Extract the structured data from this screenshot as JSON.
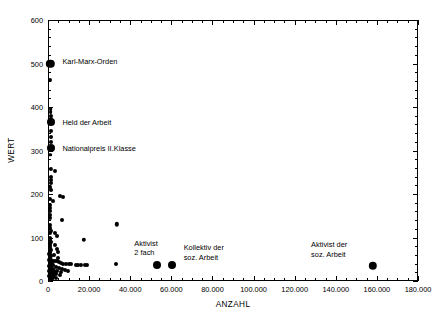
{
  "chart_data": {
    "type": "scatter",
    "title": "",
    "xlabel": "ANZAHL",
    "ylabel": "WERT",
    "xlim": [
      0,
      180000
    ],
    "ylim": [
      0,
      600
    ],
    "xticks": [
      0,
      20000,
      40000,
      60000,
      80000,
      100000,
      120000,
      140000,
      160000,
      180000
    ],
    "xticklabels": [
      "0",
      "20.000",
      "40.000",
      "60.000",
      "80.000",
      "100.000",
      "120.000",
      "140.000",
      "160.000",
      "180.000"
    ],
    "yticks": [
      0,
      100,
      200,
      300,
      400,
      500,
      600
    ],
    "yticklabels": [
      "0",
      "100",
      "200",
      "300",
      "400",
      "500",
      "600"
    ],
    "x_minor_step": 5000,
    "y_minor_step": 20,
    "grid": false,
    "legend": null,
    "marker_color": "#000000",
    "points": [
      {
        "x": 1200,
        "y": 500,
        "r": 4.2
      },
      {
        "x": 1100,
        "y": 462,
        "r": 2.0
      },
      {
        "x": 1300,
        "y": 395,
        "r": 1.9
      },
      {
        "x": 1300,
        "y": 388,
        "r": 1.9
      },
      {
        "x": 1300,
        "y": 380,
        "r": 2.0
      },
      {
        "x": 1300,
        "y": 373,
        "r": 2.1
      },
      {
        "x": 1400,
        "y": 365,
        "r": 4.0
      },
      {
        "x": 1300,
        "y": 345,
        "r": 2.0
      },
      {
        "x": 1300,
        "y": 330,
        "r": 2.0
      },
      {
        "x": 1300,
        "y": 320,
        "r": 2.0
      },
      {
        "x": 1400,
        "y": 305,
        "r": 4.0
      },
      {
        "x": 1200,
        "y": 290,
        "r": 1.8
      },
      {
        "x": 1500,
        "y": 257,
        "r": 2.1
      },
      {
        "x": 3500,
        "y": 252,
        "r": 2.0
      },
      {
        "x": 1300,
        "y": 240,
        "r": 2.0
      },
      {
        "x": 1300,
        "y": 232,
        "r": 2.0
      },
      {
        "x": 1300,
        "y": 225,
        "r": 2.0
      },
      {
        "x": 1200,
        "y": 217,
        "r": 2.0
      },
      {
        "x": 1300,
        "y": 210,
        "r": 2.0
      },
      {
        "x": 6000,
        "y": 196,
        "r": 2.0
      },
      {
        "x": 7200,
        "y": 193,
        "r": 2.0
      },
      {
        "x": 1200,
        "y": 188,
        "r": 2.0
      },
      {
        "x": 2500,
        "y": 183,
        "r": 2.0
      },
      {
        "x": 1100,
        "y": 175,
        "r": 2.0
      },
      {
        "x": 1100,
        "y": 168,
        "r": 2.0
      },
      {
        "x": 1200,
        "y": 160,
        "r": 2.0
      },
      {
        "x": 1100,
        "y": 152,
        "r": 2.0
      },
      {
        "x": 1200,
        "y": 145,
        "r": 2.0
      },
      {
        "x": 7000,
        "y": 141,
        "r": 2.0
      },
      {
        "x": 33500,
        "y": 130,
        "r": 2.2
      },
      {
        "x": 1200,
        "y": 128,
        "r": 2.0
      },
      {
        "x": 1100,
        "y": 122,
        "r": 2.0
      },
      {
        "x": 1300,
        "y": 116,
        "r": 2.0
      },
      {
        "x": 1200,
        "y": 110,
        "r": 2.0
      },
      {
        "x": 3400,
        "y": 110,
        "r": 2.0
      },
      {
        "x": 4300,
        "y": 103,
        "r": 2.0
      },
      {
        "x": 1200,
        "y": 100,
        "r": 2.0
      },
      {
        "x": 1100,
        "y": 95,
        "r": 2.0
      },
      {
        "x": 17500,
        "y": 95,
        "r": 2.2
      },
      {
        "x": 1300,
        "y": 90,
        "r": 2.0
      },
      {
        "x": 1200,
        "y": 85,
        "r": 2.0
      },
      {
        "x": 3600,
        "y": 83,
        "r": 2.0
      },
      {
        "x": 1100,
        "y": 80,
        "r": 2.0
      },
      {
        "x": 1200,
        "y": 76,
        "r": 2.0
      },
      {
        "x": 4200,
        "y": 74,
        "r": 2.0
      },
      {
        "x": 1300,
        "y": 72,
        "r": 2.0
      },
      {
        "x": 1100,
        "y": 68,
        "r": 2.0
      },
      {
        "x": 5000,
        "y": 66,
        "r": 2.0
      },
      {
        "x": 1200,
        "y": 64,
        "r": 2.0
      },
      {
        "x": 1100,
        "y": 60,
        "r": 2.0
      },
      {
        "x": 3000,
        "y": 60,
        "r": 2.0
      },
      {
        "x": 1300,
        "y": 57,
        "r": 2.0
      },
      {
        "x": 1200,
        "y": 54,
        "r": 2.0
      },
      {
        "x": 4800,
        "y": 52,
        "r": 2.0
      },
      {
        "x": 1100,
        "y": 50,
        "r": 2.0
      },
      {
        "x": 1300,
        "y": 48,
        "r": 2.0
      },
      {
        "x": 2200,
        "y": 47,
        "r": 2.0
      },
      {
        "x": 3300,
        "y": 46,
        "r": 2.0
      },
      {
        "x": 4500,
        "y": 45,
        "r": 2.0
      },
      {
        "x": 5500,
        "y": 44,
        "r": 2.0
      },
      {
        "x": 1200,
        "y": 44,
        "r": 2.0
      },
      {
        "x": 1100,
        "y": 42,
        "r": 2.0
      },
      {
        "x": 6500,
        "y": 42,
        "r": 2.0
      },
      {
        "x": 1300,
        "y": 40,
        "r": 2.0
      },
      {
        "x": 2000,
        "y": 40,
        "r": 2.0
      },
      {
        "x": 7500,
        "y": 40,
        "r": 2.0
      },
      {
        "x": 8800,
        "y": 39,
        "r": 2.0
      },
      {
        "x": 1200,
        "y": 38,
        "r": 2.0
      },
      {
        "x": 10000,
        "y": 38,
        "r": 2.0
      },
      {
        "x": 11200,
        "y": 38,
        "r": 2.0
      },
      {
        "x": 1100,
        "y": 36,
        "r": 2.0
      },
      {
        "x": 2600,
        "y": 36,
        "r": 2.0
      },
      {
        "x": 13500,
        "y": 37,
        "r": 2.0
      },
      {
        "x": 14800,
        "y": 37,
        "r": 2.0
      },
      {
        "x": 16000,
        "y": 36,
        "r": 2.0
      },
      {
        "x": 1300,
        "y": 34,
        "r": 2.0
      },
      {
        "x": 17800,
        "y": 36,
        "r": 2.0
      },
      {
        "x": 19200,
        "y": 36,
        "r": 2.0
      },
      {
        "x": 1200,
        "y": 32,
        "r": 2.0
      },
      {
        "x": 3900,
        "y": 32,
        "r": 2.0
      },
      {
        "x": 33000,
        "y": 38,
        "r": 2.0
      },
      {
        "x": 1100,
        "y": 30,
        "r": 2.0
      },
      {
        "x": 5200,
        "y": 30,
        "r": 2.0
      },
      {
        "x": 1300,
        "y": 28,
        "r": 2.0
      },
      {
        "x": 2400,
        "y": 28,
        "r": 2.0
      },
      {
        "x": 6800,
        "y": 28,
        "r": 2.0
      },
      {
        "x": 1200,
        "y": 26,
        "r": 2.0
      },
      {
        "x": 8200,
        "y": 26,
        "r": 2.0
      },
      {
        "x": 1100,
        "y": 24,
        "r": 2.0
      },
      {
        "x": 3100,
        "y": 24,
        "r": 2.0
      },
      {
        "x": 9600,
        "y": 24,
        "r": 2.0
      },
      {
        "x": 1300,
        "y": 22,
        "r": 2.0
      },
      {
        "x": 4600,
        "y": 22,
        "r": 2.0
      },
      {
        "x": 1200,
        "y": 20,
        "r": 2.0
      },
      {
        "x": 2800,
        "y": 20,
        "r": 2.0
      },
      {
        "x": 6200,
        "y": 20,
        "r": 2.0
      },
      {
        "x": 1100,
        "y": 18,
        "r": 2.0
      },
      {
        "x": 1900,
        "y": 18,
        "r": 2.0
      },
      {
        "x": 1300,
        "y": 16,
        "r": 2.0
      },
      {
        "x": 3700,
        "y": 16,
        "r": 2.0
      },
      {
        "x": 1200,
        "y": 14,
        "r": 2.0
      },
      {
        "x": 2300,
        "y": 14,
        "r": 2.0
      },
      {
        "x": 5800,
        "y": 13,
        "r": 2.0
      },
      {
        "x": 1100,
        "y": 12,
        "r": 2.0
      },
      {
        "x": 1600,
        "y": 11,
        "r": 2.0
      },
      {
        "x": 1300,
        "y": 10,
        "r": 2.0
      },
      {
        "x": 2900,
        "y": 10,
        "r": 2.0
      },
      {
        "x": 1200,
        "y": 8,
        "r": 2.0
      },
      {
        "x": 4000,
        "y": 8,
        "r": 2.0
      },
      {
        "x": 1100,
        "y": 6,
        "r": 2.0
      },
      {
        "x": 1800,
        "y": 6,
        "r": 2.0
      },
      {
        "x": 1300,
        "y": 5,
        "r": 2.0
      },
      {
        "x": 2100,
        "y": 4,
        "r": 2.0
      },
      {
        "x": 1200,
        "y": 3,
        "r": 2.0
      },
      {
        "x": 700,
        "y": 62,
        "r": 2.0
      },
      {
        "x": 700,
        "y": 48,
        "r": 2.0
      },
      {
        "x": 700,
        "y": 35,
        "r": 2.0
      },
      {
        "x": 700,
        "y": 22,
        "r": 2.0
      },
      {
        "x": 700,
        "y": 12,
        "r": 2.0
      },
      {
        "x": 53000,
        "y": 37,
        "r": 4.0
      },
      {
        "x": 60500,
        "y": 37,
        "r": 4.0
      },
      {
        "x": 158000,
        "y": 35,
        "r": 4.2
      }
    ],
    "annotations": [
      {
        "text": "Karl-Marx-Orden",
        "x": 7000,
        "y": 503,
        "align": "left"
      },
      {
        "text": "Held der Arbeit",
        "x": 7000,
        "y": 363,
        "align": "left"
      },
      {
        "text": "Nationalpreis II.Klasse",
        "x": 7000,
        "y": 303,
        "align": "left"
      },
      {
        "text": "Aktivist\n2 fach",
        "x": 42000,
        "y": 86,
        "align": "left"
      },
      {
        "text": "Kollektiv der\nsoz. Arbeit",
        "x": 66000,
        "y": 75,
        "align": "left"
      },
      {
        "text": "Aktivist der\nsoz. Arbeit",
        "x": 128000,
        "y": 82,
        "align": "left"
      }
    ]
  }
}
